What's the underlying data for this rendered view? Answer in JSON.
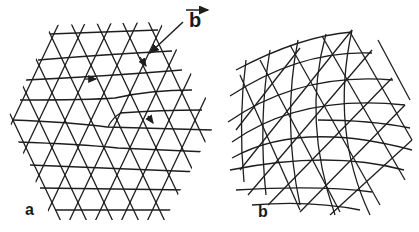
{
  "figure": {
    "panel_a": {
      "label": "a",
      "description": "triangular lattice containing an edge dislocation, hexagonal crystal outline"
    },
    "panel_b": {
      "label": "b",
      "description": "curved (bent) triangular lattice, disclination-like distortion"
    },
    "burgers_vector": {
      "label": "b",
      "arrow": "rightward arrow above label"
    }
  },
  "colors": {
    "line": "#1e1e1e",
    "background": "#ffffff"
  }
}
